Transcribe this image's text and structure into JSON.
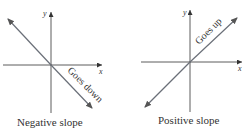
{
  "panels": [
    {
      "caption": "Negative slope",
      "label": "Goes down",
      "x_label": "x",
      "y_label": "y"
    },
    {
      "caption": "Positive slope",
      "label": "Goes up",
      "x_label": "x",
      "y_label": "y"
    }
  ],
  "colors": {
    "axis": "#333333",
    "line": "#6a6f78",
    "text": "#333333"
  }
}
